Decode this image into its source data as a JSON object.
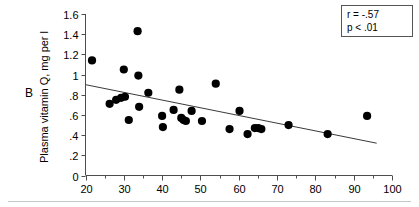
{
  "panel": {
    "letter": "B"
  },
  "annotations": {
    "correlation": "r = -.57",
    "pvalue": "p < .01"
  },
  "chart_data": {
    "type": "scatter",
    "title": "",
    "xlabel": "",
    "ylabel": "Plasma vitamin Q, mg per l",
    "xlim": [
      20,
      100
    ],
    "ylim": [
      0,
      1.6
    ],
    "xticks": [
      20,
      30,
      40,
      50,
      60,
      70,
      80,
      90,
      100
    ],
    "xtick_labels": [
      "20",
      "30",
      "40",
      "50",
      "60",
      "70",
      "80",
      "90",
      "100"
    ],
    "xtick_minor_step": 5,
    "yticks": [
      0,
      0.2,
      0.4,
      0.6,
      0.8,
      1.0,
      1.2,
      1.4,
      1.6
    ],
    "ytick_labels": [
      "0",
      ".2",
      ".4",
      ".6",
      ".8",
      "1",
      "1.2",
      "1.4",
      "1.6"
    ],
    "grid": false,
    "legend": "none",
    "marker": "filled-circle",
    "marker_color": "#000000",
    "points": [
      {
        "x": 21.7,
        "y": 1.14
      },
      {
        "x": 26.3,
        "y": 0.71
      },
      {
        "x": 28.0,
        "y": 0.75
      },
      {
        "x": 29.3,
        "y": 0.77
      },
      {
        "x": 30.0,
        "y": 1.05
      },
      {
        "x": 30.3,
        "y": 0.78
      },
      {
        "x": 31.3,
        "y": 0.55
      },
      {
        "x": 33.6,
        "y": 1.43
      },
      {
        "x": 33.8,
        "y": 0.99
      },
      {
        "x": 34.0,
        "y": 0.68
      },
      {
        "x": 36.4,
        "y": 0.82
      },
      {
        "x": 40.0,
        "y": 0.59
      },
      {
        "x": 40.2,
        "y": 0.48
      },
      {
        "x": 43.0,
        "y": 0.65
      },
      {
        "x": 44.5,
        "y": 0.85
      },
      {
        "x": 45.0,
        "y": 0.57
      },
      {
        "x": 45.6,
        "y": 0.55
      },
      {
        "x": 46.2,
        "y": 0.54
      },
      {
        "x": 47.7,
        "y": 0.64
      },
      {
        "x": 50.4,
        "y": 0.54
      },
      {
        "x": 54.0,
        "y": 0.91
      },
      {
        "x": 57.6,
        "y": 0.46
      },
      {
        "x": 60.2,
        "y": 0.64
      },
      {
        "x": 62.3,
        "y": 0.41
      },
      {
        "x": 64.2,
        "y": 0.47
      },
      {
        "x": 65.1,
        "y": 0.47
      },
      {
        "x": 65.9,
        "y": 0.46
      },
      {
        "x": 73.0,
        "y": 0.5
      },
      {
        "x": 83.2,
        "y": 0.41
      },
      {
        "x": 93.5,
        "y": 0.59
      }
    ],
    "fit_line": {
      "x_start": 20,
      "y_start": 0.9,
      "x_end": 96,
      "y_end": 0.32
    }
  }
}
